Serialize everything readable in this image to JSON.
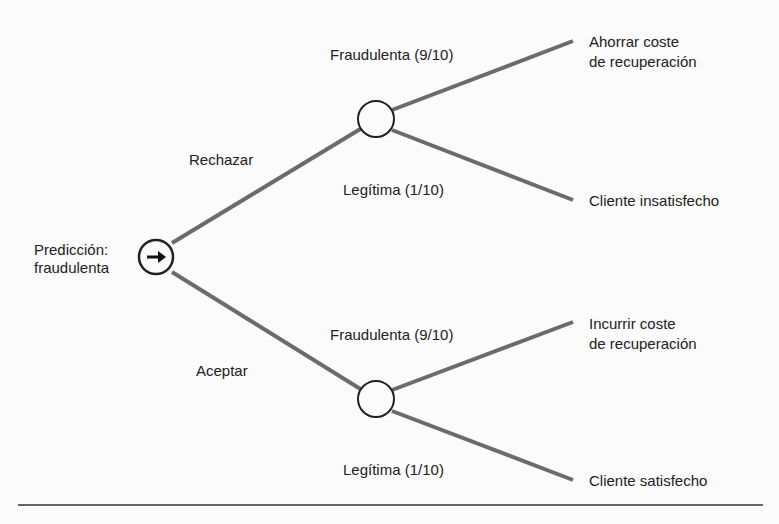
{
  "root": {
    "label_line1": "Predicción:",
    "label_line2": "fraudulenta",
    "icon": "arrow-right-icon"
  },
  "branches": {
    "reject": {
      "label": "Rechazar"
    },
    "accept": {
      "label": "Aceptar"
    }
  },
  "reject_outcomes": {
    "fraud": {
      "label": "Fraudulenta (9/10)",
      "result_line1": "Ahorrar coste",
      "result_line2": "de recuperación"
    },
    "legit": {
      "label": "Legítima (1/10)",
      "result": "Cliente insatisfecho"
    }
  },
  "accept_outcomes": {
    "fraud": {
      "label": "Fraudulenta (9/10)",
      "result_line1": "Incurrir coste",
      "result_line2": "de recuperación"
    },
    "legit": {
      "label": "Legítima (1/10)",
      "result": "Cliente satisfecho"
    }
  },
  "colors": {
    "line": "#6b6b6b",
    "node_stroke": "#222222",
    "rule": "#333333"
  }
}
